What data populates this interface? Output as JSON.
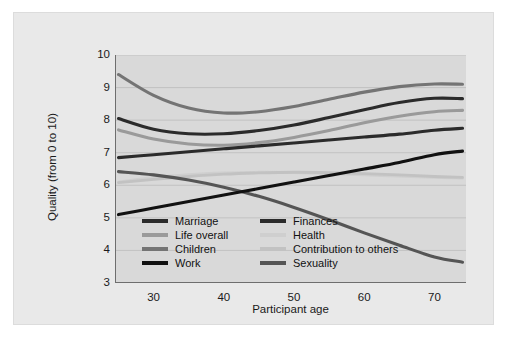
{
  "chart_data": {
    "type": "line",
    "title": "",
    "xlabel": "Participant age",
    "ylabel": "Quality (from 0 to 10)",
    "xlim": [
      24.5,
      74.5
    ],
    "ylim": [
      3,
      10
    ],
    "xticks": [
      30,
      40,
      50,
      60,
      70
    ],
    "yticks": [
      3,
      4,
      5,
      6,
      7,
      8,
      9,
      10
    ],
    "grid": true,
    "legend_position": "inside lower-left, two columns",
    "x": [
      25,
      30,
      35,
      40,
      45,
      50,
      55,
      60,
      65,
      70,
      74
    ],
    "series": [
      {
        "name": "Marriage",
        "color": "#2b2b2b",
        "width": 3.1,
        "values": [
          8.05,
          7.72,
          7.58,
          7.58,
          7.68,
          7.85,
          8.08,
          8.32,
          8.54,
          8.67,
          8.66
        ]
      },
      {
        "name": "Life overall",
        "color": "#9a9a9a",
        "width": 3.1,
        "values": [
          7.7,
          7.42,
          7.27,
          7.23,
          7.31,
          7.47,
          7.68,
          7.92,
          8.12,
          8.26,
          8.3
        ]
      },
      {
        "name": "Children",
        "color": "#747474",
        "width": 3.1,
        "values": [
          9.4,
          8.76,
          8.37,
          8.22,
          8.26,
          8.42,
          8.64,
          8.86,
          9.03,
          9.11,
          9.1
        ]
      },
      {
        "name": "Work",
        "color": "#111111",
        "width": 3.1,
        "values": [
          5.1,
          5.3,
          5.5,
          5.7,
          5.9,
          6.1,
          6.3,
          6.5,
          6.7,
          6.94,
          7.05
        ]
      },
      {
        "name": "Finances",
        "color": "#2b2b2b",
        "width": 3.1,
        "values": [
          6.85,
          6.94,
          7.03,
          7.12,
          7.21,
          7.3,
          7.39,
          7.48,
          7.57,
          7.69,
          7.75
        ]
      },
      {
        "name": "Health",
        "color": "#cfcfcf",
        "width": 2.8,
        "values": [
          6.1,
          6.24,
          6.33,
          6.38,
          6.4,
          6.39,
          6.36,
          6.32,
          6.28,
          6.24,
          6.22
        ]
      },
      {
        "name": "Contribution to others",
        "color": "#c2c2c2",
        "width": 2.8,
        "values": [
          6.08,
          6.18,
          6.27,
          6.34,
          6.38,
          6.4,
          6.39,
          6.36,
          6.32,
          6.27,
          6.24
        ]
      },
      {
        "name": "Sexuality",
        "color": "#555555",
        "width": 3.1,
        "values": [
          6.42,
          6.32,
          6.16,
          5.94,
          5.66,
          5.32,
          4.94,
          4.54,
          4.16,
          3.8,
          3.64
        ]
      }
    ]
  },
  "axes": {
    "x_title": "Participant age",
    "y_title": "Quality (from 0 to 10)",
    "xticks": [
      "30",
      "40",
      "50",
      "60",
      "70"
    ],
    "yticks": [
      "10",
      "9",
      "8",
      "7",
      "6",
      "5",
      "4",
      "3"
    ]
  },
  "legend": {
    "entries": [
      {
        "label": "Marriage",
        "color": "#2b2b2b"
      },
      {
        "label": "Finances",
        "color": "#2b2b2b"
      },
      {
        "label": "Life overall",
        "color": "#9a9a9a"
      },
      {
        "label": "Health",
        "color": "#cfcfcf"
      },
      {
        "label": "Children",
        "color": "#747474"
      },
      {
        "label": "Contribution to others",
        "color": "#c2c2c2"
      },
      {
        "label": "Work",
        "color": "#111111"
      },
      {
        "label": "Sexuality",
        "color": "#555555"
      }
    ]
  },
  "colors": {
    "page_background": "#ffffff",
    "panel_background": "#e9e9e9",
    "plot_background": "#d9d9d9",
    "gridline": "#bdbdbd",
    "axis_line": "#6e6e6e",
    "text": "#1a1a1a"
  }
}
